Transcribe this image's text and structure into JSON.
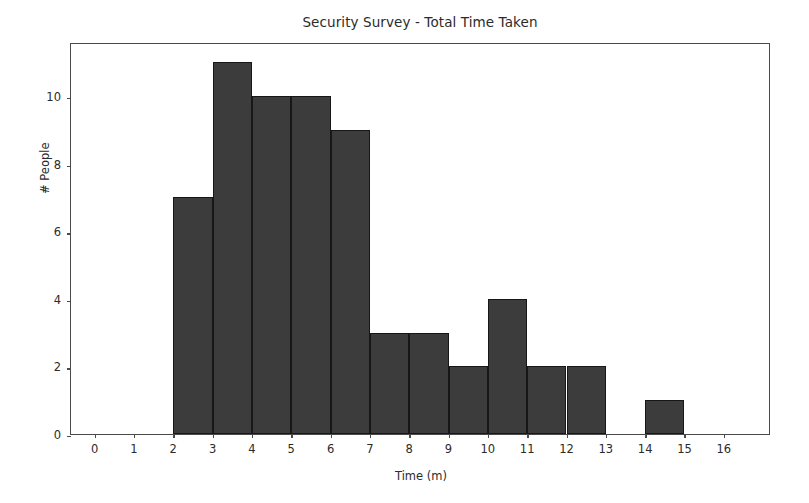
{
  "chart_data": {
    "type": "bar",
    "title": "Security Survey - Total Time Taken",
    "xlabel": "Time (m)",
    "ylabel": "# People",
    "xlim": [
      -0.6,
      17.2
    ],
    "ylim": [
      0,
      11.6
    ],
    "grid": false,
    "legend": null,
    "bin_width": 1,
    "bin_edges": [
      2,
      3,
      4,
      5,
      6,
      7,
      8,
      9,
      10,
      11,
      12,
      13,
      14,
      15
    ],
    "categories": [
      "2-3",
      "3-4",
      "4-5",
      "5-6",
      "6-7",
      "7-8",
      "8-9",
      "9-10",
      "10-11",
      "11-12",
      "12-13",
      "13-14",
      "14-15"
    ],
    "values": [
      7,
      11,
      10,
      10,
      9,
      3,
      3,
      2,
      4,
      2,
      2,
      0,
      1
    ],
    "x_ticks": [
      0,
      1,
      2,
      3,
      4,
      5,
      6,
      7,
      8,
      9,
      10,
      11,
      12,
      13,
      14,
      15,
      16
    ],
    "x_tick_labels": [
      "0",
      "1",
      "2",
      "3",
      "4",
      "5",
      "6",
      "7",
      "8",
      "9",
      "10",
      "11",
      "12",
      "13",
      "14",
      "15",
      "16"
    ],
    "y_ticks": [
      0,
      2,
      4,
      6,
      8,
      10
    ],
    "y_tick_labels": [
      "0",
      "2",
      "4",
      "6",
      "8",
      "10"
    ],
    "bar_color": "#3c3c3c",
    "bar_edge_color": "#171717",
    "axes_color": "#4a4a4a",
    "background_color": "#ffffff",
    "total_people": 64
  }
}
